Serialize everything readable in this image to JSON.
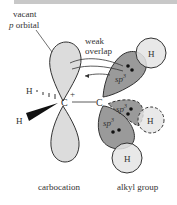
{
  "labels": {
    "vacant_line1": "vacant",
    "vacant_line2_italic": "p",
    "vacant_line2_rest": " orbital",
    "weak": "weak",
    "overlap": "overlap",
    "carbon_cation": "C",
    "plus": "+",
    "carbon_alkyl": "C",
    "h_dashed": "H",
    "h_wedge": "H",
    "sp3": "sp",
    "sp3_sup": "3",
    "h_top": "H",
    "h_right": "H",
    "h_bottom": "H",
    "caption_left": "carbocation",
    "caption_right": "alkyl group"
  },
  "colors": {
    "lobe_fill": "#dcdcdc",
    "sp3_fill": "#9a9a9a",
    "h_fill": "#e4e4e4",
    "stroke": "#333333"
  }
}
